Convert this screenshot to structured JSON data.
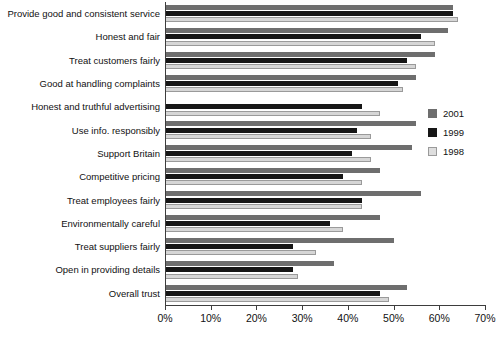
{
  "chart_data": {
    "type": "bar",
    "orientation": "horizontal",
    "title": "",
    "xlabel": "",
    "ylabel": "",
    "xlim": [
      0,
      70
    ],
    "xunit": "%",
    "grid": false,
    "legend_position": "right",
    "xticks": [
      "0%",
      "10%",
      "20%",
      "30%",
      "40%",
      "50%",
      "60%",
      "70%"
    ],
    "xtick_values": [
      0,
      10,
      20,
      30,
      40,
      50,
      60,
      70
    ],
    "categories": [
      "Provide good and consistent service",
      "Honest and fair",
      "Treat customers fairly",
      "Good at handling complaints",
      "Honest and truthful advertising",
      "Use info. responsibly",
      "Support Britain",
      "Competitive pricing",
      "Treat employees fairly",
      "Environmentally careful",
      "Treat suppliers fairly",
      "Open in providing details",
      "Overall trust"
    ],
    "series": [
      {
        "name": "2001",
        "color": "#6e6e6e",
        "values": [
          63,
          62,
          59,
          55,
          null,
          55,
          54,
          47,
          56,
          47,
          50,
          37,
          53
        ]
      },
      {
        "name": "1999",
        "color": "#161616",
        "values": [
          63,
          56,
          53,
          51,
          43,
          42,
          41,
          39,
          43,
          36,
          28,
          28,
          47
        ]
      },
      {
        "name": "1998",
        "color": "#d6d6d6",
        "values": [
          64,
          59,
          55,
          52,
          47,
          45,
          45,
          43,
          43,
          39,
          33,
          29,
          49
        ]
      }
    ]
  },
  "legend": {
    "entries": [
      {
        "label": "2001",
        "color": "#6e6e6e"
      },
      {
        "label": "1999",
        "color": "#161616"
      },
      {
        "label": "1998",
        "color": "#d6d6d6"
      }
    ]
  }
}
